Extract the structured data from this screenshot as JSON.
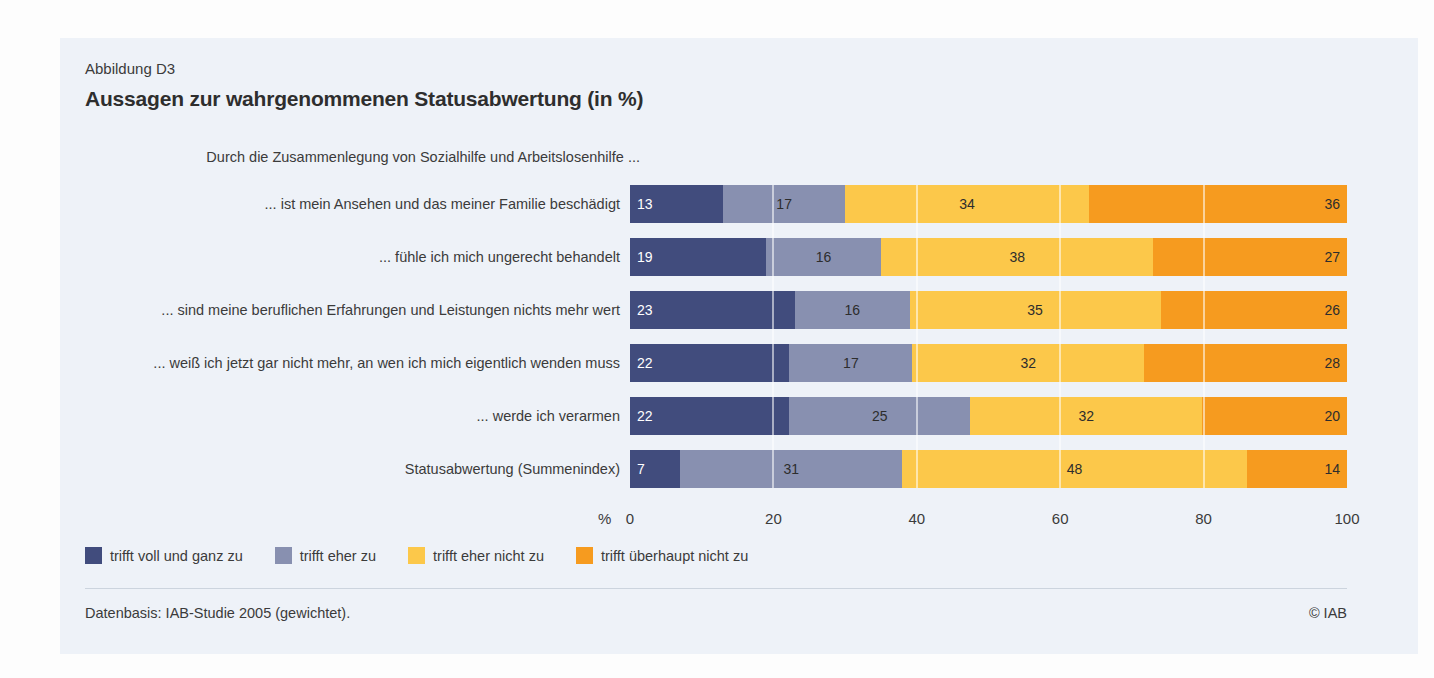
{
  "figure": {
    "label": "Abbildung D3",
    "title": "Aussagen zur wahrgenommenen Statusabwertung (in %)",
    "source": "Datenbasis: IAB-Studie 2005 (gewichtet).",
    "copyright": "© IAB"
  },
  "chart_data": {
    "type": "bar",
    "orientation": "horizontal-stacked",
    "group_header": "Durch die Zusammenlegung von Sozialhilfe und Arbeitslosenhilfe ...",
    "categories": [
      "... ist mein Ansehen und das meiner Familie beschädigt",
      "... fühle ich mich ungerecht behandelt",
      "... sind meine beruflichen Erfahrungen und Leistungen nichts mehr wert",
      "... weiß ich jetzt gar nicht mehr, an wen ich mich eigentlich wenden muss",
      "... werde ich verarmen",
      "Statusabwertung (Summenindex)"
    ],
    "series": [
      {
        "name": "trifft voll und ganz zu",
        "color": "#414c7d",
        "values": [
          13,
          19,
          23,
          22,
          22,
          7
        ]
      },
      {
        "name": "trifft eher zu",
        "color": "#8890b0",
        "values": [
          17,
          16,
          16,
          17,
          25,
          31
        ]
      },
      {
        "name": "trifft eher nicht zu",
        "color": "#fcc84a",
        "values": [
          34,
          38,
          35,
          32,
          32,
          48
        ]
      },
      {
        "name": "trifft überhaupt nicht zu",
        "color": "#f69b1f",
        "values": [
          36,
          27,
          26,
          28,
          20,
          14
        ]
      }
    ],
    "xlabel": "%",
    "x_ticks": [
      0,
      20,
      40,
      60,
      80,
      100
    ],
    "xlim": [
      0,
      100
    ],
    "grid": "vertical-white-lines",
    "legend_position": "bottom"
  }
}
